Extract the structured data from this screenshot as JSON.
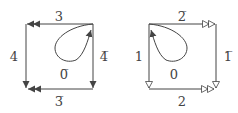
{
  "diagrams": [
    {
      "name": "left-square",
      "arrow_style": "filled-double",
      "edges": {
        "top": {
          "label": "3",
          "direction": "right-to-left"
        },
        "left": {
          "label": "4",
          "direction": "top-to-bottom"
        },
        "right": {
          "label": "4̅",
          "direction": "top-to-bottom"
        },
        "bottom": {
          "label": "3̅",
          "direction": "right-to-left"
        }
      },
      "loop": {
        "label": "0̅",
        "at": "top-right"
      }
    },
    {
      "name": "right-square",
      "arrow_style": "hollow-double",
      "edges": {
        "top": {
          "label": "2̅",
          "direction": "left-to-right"
        },
        "left": {
          "label": "1",
          "direction": "top-to-bottom"
        },
        "right": {
          "label": "1̅",
          "direction": "top-to-bottom"
        },
        "bottom": {
          "label": "2",
          "direction": "left-to-right"
        }
      },
      "loop": {
        "label": "0",
        "at": "top-left"
      }
    }
  ],
  "colors": {
    "line": "#444444",
    "background": "#ffffff"
  }
}
